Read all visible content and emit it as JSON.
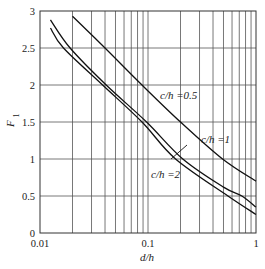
{
  "chart_data": {
    "type": "line",
    "title": "",
    "xlabel": "d/h",
    "ylabel": "F1",
    "xscale": "log",
    "xlim": [
      0.01,
      1
    ],
    "ylim": [
      0,
      3
    ],
    "grid": true,
    "x_ticks": [
      {
        "value": 0.01,
        "label": "0.01"
      },
      {
        "value": 0.1,
        "label": "0.1"
      },
      {
        "value": 1,
        "label": "1"
      }
    ],
    "y_ticks": [
      {
        "value": 0,
        "label": "0"
      },
      {
        "value": 0.5,
        "label": "0.5"
      },
      {
        "value": 1,
        "label": "1"
      },
      {
        "value": 1.5,
        "label": "1.5"
      },
      {
        "value": 2,
        "label": "2"
      },
      {
        "value": 2.5,
        "label": "2.5"
      },
      {
        "value": 3,
        "label": "3"
      }
    ],
    "series": [
      {
        "name": "c/h =0.5",
        "x": [
          0.02,
          0.04,
          0.088,
          0.2,
          0.49,
          1.0
        ],
        "y": [
          2.93,
          2.5,
          2.0,
          1.5,
          1.0,
          0.7
        ]
      },
      {
        "name": "c/h =1",
        "x": [
          0.0125,
          0.019,
          0.041,
          0.097,
          0.21,
          0.5,
          0.74,
          1.0
        ],
        "y": [
          2.88,
          2.5,
          2.0,
          1.5,
          1.0,
          0.62,
          0.5,
          0.35
        ]
      },
      {
        "name": "c/h =2",
        "x": [
          0.0125,
          0.0165,
          0.038,
          0.088,
          0.18,
          0.55,
          1.0
        ],
        "y": [
          2.77,
          2.5,
          2.0,
          1.5,
          1.0,
          0.5,
          0.25
        ]
      }
    ],
    "annotations": [
      {
        "text": "c/h =0.5",
        "series": 0
      },
      {
        "text": "c/h =1",
        "series": 1,
        "leader_line": true
      },
      {
        "text": "c/h =2",
        "series": 2
      }
    ]
  }
}
